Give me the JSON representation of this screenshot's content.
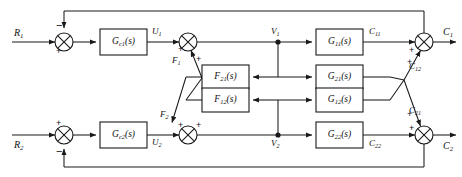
{
  "diagram": {
    "type": "control-block-diagram",
    "stroke_color": "#1a1a1a",
    "background_color": "#ffffff",
    "inputs": [
      {
        "id": "R1",
        "label": "R",
        "sub": "1"
      },
      {
        "id": "R2",
        "label": "R",
        "sub": "2"
      }
    ],
    "outputs": [
      {
        "id": "C1",
        "label": "C",
        "sub": "1"
      },
      {
        "id": "C2",
        "label": "C",
        "sub": "2"
      }
    ],
    "blocks": [
      {
        "id": "Gc1",
        "label": "G",
        "sub": "c1",
        "suffix": "(s)"
      },
      {
        "id": "Gc2",
        "label": "G",
        "sub": "c2",
        "suffix": "(s)"
      },
      {
        "id": "F21",
        "label": "F",
        "sub": "21",
        "suffix": "(s)"
      },
      {
        "id": "F12",
        "label": "F",
        "sub": "12",
        "suffix": "(s)"
      },
      {
        "id": "G11",
        "label": "G",
        "sub": "11",
        "suffix": "(s)"
      },
      {
        "id": "G21",
        "label": "G",
        "sub": "21",
        "suffix": "(s)"
      },
      {
        "id": "G12",
        "label": "G",
        "sub": "12",
        "suffix": "(s)"
      },
      {
        "id": "G22",
        "label": "G",
        "sub": "22",
        "suffix": "(s)"
      }
    ],
    "signals": [
      {
        "id": "U1",
        "label": "U",
        "sub": "1"
      },
      {
        "id": "U2",
        "label": "U",
        "sub": "2"
      },
      {
        "id": "F1",
        "label": "F",
        "sub": "1"
      },
      {
        "id": "F2",
        "label": "F",
        "sub": "2"
      },
      {
        "id": "V1",
        "label": "V",
        "sub": "1"
      },
      {
        "id": "V2",
        "label": "V",
        "sub": "2"
      },
      {
        "id": "C11",
        "label": "C",
        "sub": "11"
      },
      {
        "id": "C12",
        "label": "C",
        "sub": "12"
      },
      {
        "id": "C21",
        "label": "C",
        "sub": "21"
      },
      {
        "id": "C22",
        "label": "C",
        "sub": "22"
      }
    ],
    "summing_junctions": [
      {
        "id": "sum-r1",
        "signs": [
          "+",
          "-"
        ]
      },
      {
        "id": "sum-f1",
        "signs": [
          "+",
          "+"
        ]
      },
      {
        "id": "sum-c1",
        "signs": [
          "+",
          "+"
        ]
      },
      {
        "id": "sum-r2",
        "signs": [
          "+",
          "-"
        ]
      },
      {
        "id": "sum-f2",
        "signs": [
          "+",
          "+"
        ]
      },
      {
        "id": "sum-c2",
        "signs": [
          "+",
          "+"
        ]
      }
    ],
    "signs": {
      "plus": "+",
      "minus": "−"
    }
  }
}
